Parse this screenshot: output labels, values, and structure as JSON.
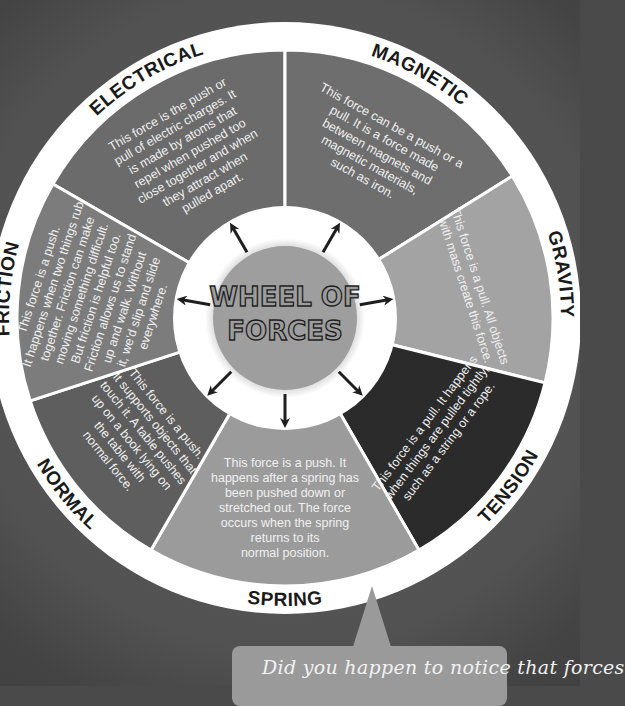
{
  "title": {
    "line1": "WHEEL OF",
    "line2": "FORCES"
  },
  "sectors": [
    {
      "name": "ELECTRICAL",
      "color": "#6b6b6b",
      "description": [
        "This force is the push or",
        "pull of electric charges. It",
        "is made by atoms that",
        "repel when pushed too",
        "close together and when",
        "they attract when",
        "pulled apart."
      ]
    },
    {
      "name": "MAGNETIC",
      "color": "#6e6e6e",
      "description": [
        "This force can be a push or a",
        "pull. It is a force made",
        "between magnets and",
        "magnetic materials,",
        "such as iron."
      ]
    },
    {
      "name": "GRAVITY",
      "color": "#a3a3a3",
      "description": [
        "This force is a pull. All objects",
        "with mass create this force."
      ]
    },
    {
      "name": "TENSION",
      "color": "#2b2b2b",
      "description": [
        "This force is a pull. It happens",
        "when things are pulled tightly,",
        "such as a string or a rope."
      ]
    },
    {
      "name": "SPRING",
      "color": "#9b9b9b",
      "description": [
        "This force is a push. It",
        "happens after a spring has",
        "been pushed down or",
        "stretched out. The force",
        "occurs when the spring",
        "returns to its",
        "normal position."
      ]
    },
    {
      "name": "NORMAL",
      "color": "#5e5e5e",
      "description": [
        "This force is a push.",
        "It supports objects that",
        "touch it. A table pushes",
        "up on a book lying on",
        "the table with",
        "normal force."
      ]
    },
    {
      "name": "FRICTION",
      "color": "#7c7c7c",
      "description": [
        "This force is a push.",
        "It happens when two things rub",
        "together. Friction can make",
        "moving something difficult.",
        "But friction is helpful too.",
        "Friction allows us to stand",
        "up and walk. Without",
        "it, we'd slip and slide",
        "everywhere."
      ]
    }
  ],
  "arrows": {
    "count": 8,
    "icon": "arrow-icon"
  },
  "callout": {
    "text": "Did you happen to notice that forces",
    "color": "#9a9a9a"
  },
  "colors": {
    "background": "#4a4a4a",
    "ring": "#ffffff",
    "hub": "#9e9e9e",
    "label_text": "#1a1a1a",
    "description_text": "#f0f0f0"
  }
}
